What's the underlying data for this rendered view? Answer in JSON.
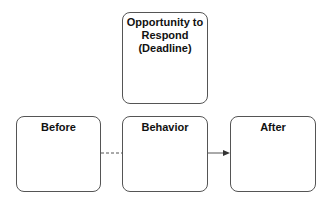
{
  "diagram": {
    "nodes": [
      {
        "id": "opportunity",
        "label": "Opportunity to\nRespond\n(Deadline)"
      },
      {
        "id": "before",
        "label": "Before"
      },
      {
        "id": "behavior",
        "label": "Behavior"
      },
      {
        "id": "after",
        "label": "After"
      }
    ],
    "edges": [
      {
        "from": "before",
        "to": "behavior",
        "style": "dashed",
        "arrow": false
      },
      {
        "from": "behavior",
        "to": "after",
        "style": "solid",
        "arrow": true
      }
    ],
    "colors": {
      "stroke": "#555555",
      "text": "#111111",
      "background": "#ffffff"
    }
  }
}
